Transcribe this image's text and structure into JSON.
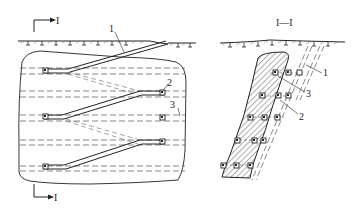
{
  "diagram": {
    "type": "mining-engineering-drawing",
    "colors": {
      "line": "#222222",
      "dashed": "#555555",
      "hatch": "#333333",
      "background": "#ffffff"
    },
    "plan_view": {
      "section_marker_top": "I",
      "section_marker_bottom": "I",
      "callouts": [
        {
          "id": "1",
          "label": "1"
        },
        {
          "id": "2",
          "label": "2"
        },
        {
          "id": "3",
          "label": "3"
        }
      ]
    },
    "section_view": {
      "title": "I—I",
      "callouts": [
        {
          "id": "1",
          "label": "1"
        },
        {
          "id": "3",
          "label": "3"
        },
        {
          "id": "2",
          "label": "2"
        }
      ]
    }
  }
}
